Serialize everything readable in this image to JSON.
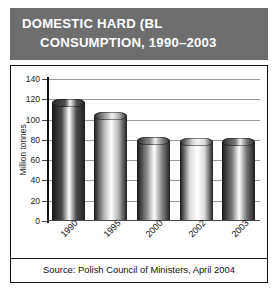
{
  "title": {
    "line1": "DOMESTIC HARD (BL",
    "line2": "CONSUMPTION, 1990–2003"
  },
  "source": {
    "text": "Source: Polish Council of Ministers, April 2004"
  },
  "colors": {
    "title_band": "#6e6e6e",
    "title_text": "#ffffff",
    "frame_border": "#141414",
    "gridline": "#9a9a9a",
    "axis": "#111111",
    "tick_text": "#1c1c1c"
  },
  "chart_data": {
    "type": "bar",
    "title": "DOMESTIC HARD (BL CONSUMPTION, 1990–2003",
    "xlabel": "",
    "ylabel": "Million tonnes",
    "categories": [
      "1990",
      "1995",
      "2000",
      "2002",
      "2003"
    ],
    "values": [
      120,
      107,
      83,
      82,
      82
    ],
    "ylim": [
      0,
      140
    ],
    "yticks": [
      0,
      20,
      40,
      60,
      80,
      100,
      120,
      140
    ],
    "ytick_labels": [
      "0",
      "20",
      "40",
      "60",
      "80",
      "100",
      "120",
      "140"
    ],
    "grid": true,
    "legend": false,
    "bar_style": "cylinder",
    "bar_colors": [
      "#4b4b4b",
      "#b4b4b4",
      "#8c8c8c",
      "#dcdcdc",
      "#777777"
    ],
    "annotation": "Source: Polish Council of Ministers, April 2004"
  }
}
